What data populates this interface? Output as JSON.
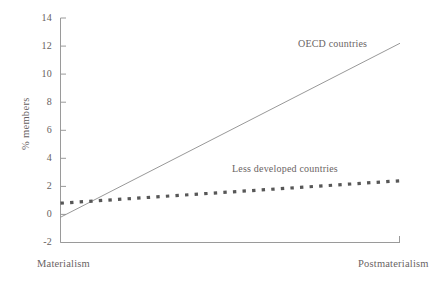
{
  "chart_data": {
    "type": "line",
    "title": "",
    "xlabel": "",
    "ylabel": "% members",
    "ylim": [
      -2,
      14
    ],
    "yticks": [
      -2,
      0,
      2,
      4,
      6,
      8,
      10,
      12,
      14
    ],
    "ytick_labels": [
      "-2",
      "0",
      "2",
      "4",
      "6",
      "8",
      "10",
      "12",
      "14"
    ],
    "grid": false,
    "legend_position": "inline-annotations",
    "x": [
      0,
      1
    ],
    "xtick_labels": [
      "Materialism",
      "Postmaterialism"
    ],
    "xlim_labels": {
      "left": "Materialism",
      "right": "Postmaterialism"
    },
    "series": [
      {
        "name": "OECD countries",
        "values": [
          -0.2,
          12.2
        ],
        "style": "solid",
        "color": "#8c8c8c",
        "linewidth": 0.9,
        "label_x": 0.72,
        "label_y": 12.4
      },
      {
        "name": "Less developed countries",
        "values": [
          0.8,
          2.4
        ],
        "style": "dotted",
        "color": "#575757",
        "linewidth": 3.2,
        "label_x": 0.56,
        "label_y": 4.1
      }
    ],
    "annotations": [
      {
        "text": "OECD countries"
      },
      {
        "text": "Less developed countries"
      }
    ]
  },
  "axis": {
    "y_title": "% members",
    "tick_0": "14",
    "tick_1": "12",
    "tick_2": "10",
    "tick_3": "8",
    "tick_4": "6",
    "tick_5": "4",
    "tick_6": "2",
    "tick_7": "0",
    "tick_8": "-2"
  },
  "categories": {
    "left": "Materialism",
    "right": "Postmaterialism"
  },
  "series_labels": {
    "oecd": "OECD countries",
    "less_developed": "Less developed countries"
  },
  "colors": {
    "axis": "#9a9a9a",
    "text": "#666060",
    "solid_line": "#8c8c8c",
    "dotted_line": "#575757",
    "background": "#ffffff"
  }
}
